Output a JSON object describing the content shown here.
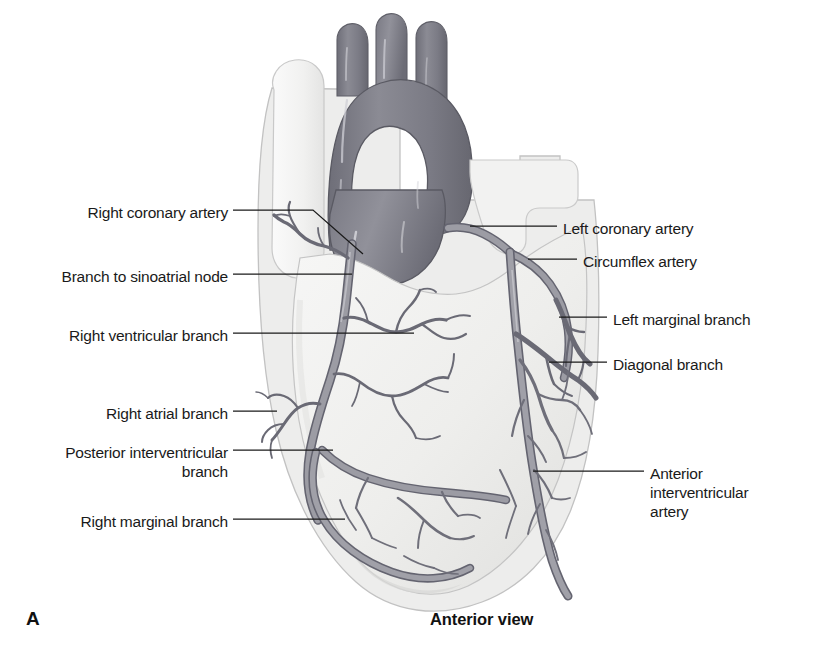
{
  "figure": {
    "letter": "A",
    "view_caption": "Anterior view"
  },
  "labels_left": [
    {
      "id": "right-coronary-artery",
      "text": "Right coronary artery",
      "x": 28,
      "y": 203,
      "width": 200
    },
    {
      "id": "branch-to-sinoatrial-node",
      "text": "Branch to sinoatrial node",
      "x": 18,
      "y": 267,
      "width": 210
    },
    {
      "id": "right-ventricular-branch",
      "text": "Right ventricular branch",
      "x": 28,
      "y": 326,
      "width": 200
    },
    {
      "id": "right-atrial-branch",
      "text": "Right atrial branch",
      "x": 58,
      "y": 404,
      "width": 170
    },
    {
      "id": "posterior-interventricular-branch",
      "text": "Posterior interventricular\nbranch",
      "x": 18,
      "y": 443,
      "width": 210
    },
    {
      "id": "right-marginal-branch",
      "text": "Right marginal branch",
      "x": 38,
      "y": 512,
      "width": 190
    }
  ],
  "labels_right": [
    {
      "id": "left-coronary-artery",
      "text": "Left coronary artery",
      "x": 563,
      "y": 219
    },
    {
      "id": "circumflex-artery",
      "text": "Circumflex artery",
      "x": 583,
      "y": 252
    },
    {
      "id": "left-marginal-branch",
      "text": "Left marginal branch",
      "x": 613,
      "y": 310
    },
    {
      "id": "diagonal-branch",
      "text": "Diagonal branch",
      "x": 613,
      "y": 355
    },
    {
      "id": "anterior-interventricular-artery",
      "text": "Anterior\ninterventricular\nartery",
      "x": 650,
      "y": 464
    }
  ],
  "colors": {
    "background": "#ffffff",
    "heart_fill": "#f0f0ef",
    "heart_edge": "#b9b9b9",
    "great_vessel_dark": "#808089",
    "great_vessel_shadow": "#6b6b74",
    "vein_light": "#e8e8e6",
    "artery_gray": "#8c8c94",
    "artery_outline": "#5f5f66",
    "leader_line": "#1a1a1a",
    "text": "#1a1a1a"
  },
  "anatomy_parts": [
    "superior vena cava",
    "aortic arch",
    "brachiocephalic trunk",
    "left common carotid artery",
    "left subclavian artery",
    "ascending aorta",
    "pulmonary trunk",
    "right atrium",
    "right ventricle",
    "left ventricle",
    "apex of heart"
  ]
}
